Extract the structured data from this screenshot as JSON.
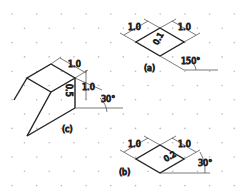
{
  "figure": {
    "a": {
      "caption": "(a)",
      "dim_left": "1.0",
      "dim_right": "1.0",
      "face_label": "0.1",
      "angle": "150°"
    },
    "b": {
      "caption": "(b)",
      "dim_left": "1.0",
      "dim_right": "1.0",
      "face_label": "0.2",
      "angle": "30°"
    },
    "c": {
      "caption": "(c)",
      "dim_top": "1.0",
      "dim_vertical": "1.0",
      "face_label": "0.5",
      "angle": "30°"
    }
  },
  "colors": {
    "line": "#222222",
    "dim": "#444444",
    "dot": "#b8b8b8"
  }
}
